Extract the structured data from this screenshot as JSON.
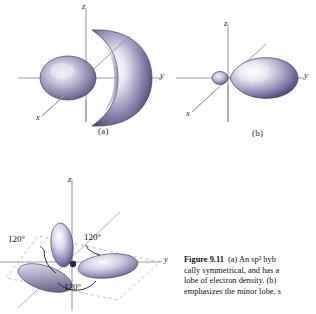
{
  "figure": {
    "number_label": "Figure 9.11",
    "caption_lines": [
      "(a) An sp² hyb",
      "cally symmetrical, and has a",
      "lobe of electron density. (b) ",
      "emphasizes the minor lobe, s"
    ],
    "caption_full": "Figure 9.11  (a) An sp2 hybrid orbital ... cally symmetrical, and has a ... lobe of electron density. (b) ... emphasizes the minor lobe, s"
  },
  "panels": [
    {
      "id": "a",
      "label": "(a)",
      "axes": [
        {
          "name": "z",
          "label": "z"
        },
        {
          "name": "y",
          "label": "y"
        },
        {
          "name": "x",
          "label": "x"
        }
      ],
      "description": "sp2 hybrid orbital with small minor lobe and large crescent major lobe"
    },
    {
      "id": "b",
      "label": "(b)",
      "axes": [
        {
          "name": "z",
          "label": "z"
        },
        {
          "name": "y",
          "label": "y"
        },
        {
          "name": "x",
          "label": "x"
        }
      ],
      "description": "simplified sp2 hybrid orbital, small minor lobe and large teardrop major lobe along y"
    },
    {
      "id": "c",
      "label": "",
      "axes": [
        {
          "name": "z",
          "label": "z"
        },
        {
          "name": "y",
          "label": "y"
        }
      ],
      "angles": [
        "120°",
        "120°",
        "120°"
      ],
      "description": "three sp2 hybrid orbitals arranged trigonal planar at 120 degrees"
    }
  ],
  "colors": {
    "lobe_dark": "#4c4470",
    "lobe_mid": "#7d76a4",
    "lobe_light": "#f2f0f7",
    "lobe_edge": "#3b3460",
    "axis": "#9a9a9a",
    "axis_dashed": "#a9a9b8",
    "text": "#111111",
    "background": "#ffffff"
  }
}
